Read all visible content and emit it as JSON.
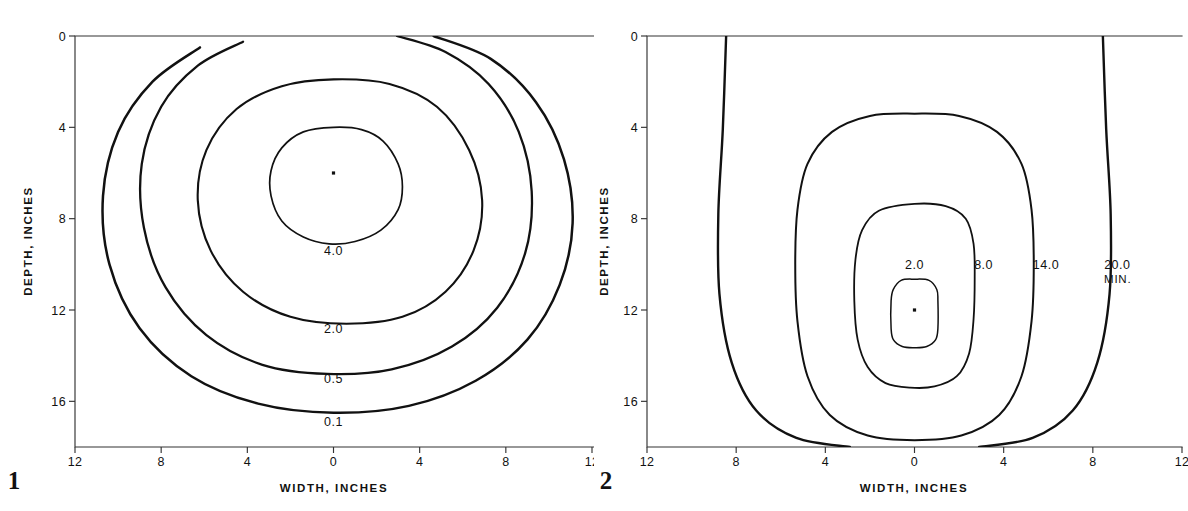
{
  "figure": {
    "kind": "contour-plot-pair",
    "background_color": "#ffffff",
    "line_color": "#111111",
    "axis_color": "#333333"
  },
  "panels": [
    {
      "number": "1",
      "xlabel": "WIDTH, INCHES",
      "ylabel": "DEPTH, INCHES",
      "x_ticks": [
        "12",
        "8",
        "4",
        "0",
        "4",
        "8",
        "12"
      ],
      "y_ticks": [
        "0",
        "4",
        "8",
        "12",
        "16"
      ],
      "unit_suffix": "",
      "contour_labels": [
        "4.0",
        "2.0",
        "0.5",
        "0.1"
      ],
      "center_marker": true
    },
    {
      "number": "2",
      "xlabel": "WIDTH,  INCHES",
      "ylabel": "DEPTH, INCHES",
      "x_ticks": [
        "12",
        "8",
        "4",
        "0",
        "4",
        "8",
        "12"
      ],
      "y_ticks": [
        "0",
        "4",
        "8",
        "12",
        "16"
      ],
      "unit_suffix": "MIN.",
      "contour_labels": [
        "2.0",
        "8.0",
        "14.0",
        "20.0"
      ],
      "center_marker": true
    }
  ],
  "chart_data": [
    {
      "type": "contour",
      "panel": "1",
      "title": "",
      "xlabel": "WIDTH, INCHES",
      "ylabel": "DEPTH, INCHES",
      "xlim": [
        -12,
        12
      ],
      "ylim": [
        0,
        18
      ],
      "y_inverted": true,
      "grid": false,
      "legend": "none",
      "x_ticks": [
        -12,
        -8,
        -4,
        0,
        4,
        8,
        12
      ],
      "x_tick_labels": [
        "12",
        "8",
        "4",
        "0",
        "4",
        "8",
        "12"
      ],
      "y_ticks": [
        0,
        4,
        8,
        12,
        16
      ],
      "y_tick_labels": [
        "0",
        "4",
        "8",
        "12",
        "16"
      ],
      "center_point": [
        0,
        6
      ],
      "levels": [
        {
          "label": "4.0",
          "label_position": [
            0,
            9.6
          ],
          "stroke_width": 1.7,
          "closed": true,
          "outline": [
            [
              0.0,
              4.0
            ],
            [
              1.3,
              4.1
            ],
            [
              2.3,
              4.6
            ],
            [
              3.0,
              5.6
            ],
            [
              3.2,
              6.6
            ],
            [
              3.0,
              7.6
            ],
            [
              2.2,
              8.5
            ],
            [
              1.0,
              9.0
            ],
            [
              -0.2,
              9.1
            ],
            [
              -1.4,
              8.8
            ],
            [
              -2.4,
              8.1
            ],
            [
              -2.9,
              7.0
            ],
            [
              -2.9,
              5.9
            ],
            [
              -2.4,
              4.9
            ],
            [
              -1.4,
              4.2
            ]
          ]
        },
        {
          "label": "2.0",
          "label_position": [
            0,
            13.0
          ],
          "stroke_width": 2.1,
          "closed": true,
          "outline": [
            [
              0.0,
              1.9
            ],
            [
              2.6,
              2.1
            ],
            [
              4.8,
              3.1
            ],
            [
              6.3,
              5.0
            ],
            [
              6.9,
              7.2
            ],
            [
              6.5,
              9.4
            ],
            [
              5.2,
              11.2
            ],
            [
              3.2,
              12.3
            ],
            [
              0.6,
              12.6
            ],
            [
              -2.0,
              12.3
            ],
            [
              -4.2,
              11.2
            ],
            [
              -5.7,
              9.4
            ],
            [
              -6.3,
              7.2
            ],
            [
              -5.9,
              5.0
            ],
            [
              -4.5,
              3.2
            ],
            [
              -2.4,
              2.2
            ]
          ]
        },
        {
          "label": "0.5",
          "label_position": [
            0,
            15.2
          ],
          "stroke_width": 2.3,
          "closed": false,
          "outline": [
            [
              2.95,
              0.0
            ],
            [
              5.2,
              0.7
            ],
            [
              7.2,
              2.1
            ],
            [
              8.6,
              4.2
            ],
            [
              9.2,
              6.8
            ],
            [
              8.9,
              9.5
            ],
            [
              7.6,
              11.9
            ],
            [
              5.5,
              13.6
            ],
            [
              2.7,
              14.6
            ],
            [
              -0.3,
              14.8
            ],
            [
              -3.3,
              14.4
            ],
            [
              -5.9,
              13.1
            ],
            [
              -7.8,
              11.0
            ],
            [
              -8.8,
              8.4
            ],
            [
              -8.9,
              5.6
            ],
            [
              -8.0,
              3.1
            ],
            [
              -6.3,
              1.3
            ],
            [
              -4.2,
              0.25
            ]
          ]
        },
        {
          "label": "0.1",
          "label_position": [
            0,
            17.1
          ],
          "stroke_width": 2.5,
          "closed": false,
          "outline": [
            [
              4.65,
              0.0
            ],
            [
              7.3,
              1.0
            ],
            [
              9.4,
              2.9
            ],
            [
              10.7,
              5.4
            ],
            [
              11.1,
              8.2
            ],
            [
              10.5,
              10.9
            ],
            [
              9.0,
              13.3
            ],
            [
              6.6,
              15.1
            ],
            [
              3.5,
              16.2
            ],
            [
              0.0,
              16.5
            ],
            [
              -3.5,
              16.1
            ],
            [
              -6.6,
              14.9
            ],
            [
              -9.0,
              12.8
            ],
            [
              -10.4,
              10.0
            ],
            [
              -10.7,
              7.0
            ],
            [
              -10.0,
              4.2
            ],
            [
              -8.4,
              2.0
            ],
            [
              -6.2,
              0.5
            ]
          ]
        }
      ]
    },
    {
      "type": "contour",
      "panel": "2",
      "title": "",
      "xlabel": "WIDTH,  INCHES",
      "ylabel": "DEPTH, INCHES",
      "xlim": [
        -12,
        12
      ],
      "ylim": [
        0,
        18
      ],
      "y_inverted": true,
      "grid": false,
      "legend": "none",
      "unit_suffix": "MIN.",
      "x_ticks": [
        -12,
        -8,
        -4,
        0,
        4,
        8,
        12
      ],
      "x_tick_labels": [
        "12",
        "8",
        "4",
        "0",
        "4",
        "8",
        "12"
      ],
      "y_ticks": [
        0,
        4,
        8,
        12,
        16
      ],
      "y_tick_labels": [
        "0",
        "4",
        "8",
        "12",
        "16"
      ],
      "center_point": [
        0,
        12
      ],
      "levels": [
        {
          "label": "2.0",
          "label_position": [
            0,
            10.2
          ],
          "stroke_width": 1.5,
          "closed": true,
          "outline": [
            [
              0.0,
              10.65
            ],
            [
              0.65,
              10.7
            ],
            [
              1.0,
              11.1
            ],
            [
              1.05,
              11.6
            ],
            [
              1.05,
              12.8
            ],
            [
              0.95,
              13.3
            ],
            [
              0.55,
              13.6
            ],
            [
              0.0,
              13.65
            ],
            [
              -0.55,
              13.6
            ],
            [
              -0.95,
              13.3
            ],
            [
              -1.05,
              12.8
            ],
            [
              -1.05,
              11.6
            ],
            [
              -0.95,
              11.1
            ],
            [
              -0.6,
              10.7
            ]
          ]
        },
        {
          "label": "8.0",
          "label_position": [
            3.1,
            10.2
          ],
          "stroke_width": 1.8,
          "closed": true,
          "outline": [
            [
              0.0,
              7.35
            ],
            [
              1.4,
              7.45
            ],
            [
              2.3,
              8.0
            ],
            [
              2.65,
              9.1
            ],
            [
              2.7,
              10.6
            ],
            [
              2.65,
              12.4
            ],
            [
              2.45,
              13.9
            ],
            [
              1.9,
              14.9
            ],
            [
              0.9,
              15.35
            ],
            [
              -0.2,
              15.4
            ],
            [
              -1.3,
              15.2
            ],
            [
              -2.1,
              14.5
            ],
            [
              -2.55,
              13.3
            ],
            [
              -2.7,
              11.6
            ],
            [
              -2.65,
              9.8
            ],
            [
              -2.35,
              8.5
            ],
            [
              -1.6,
              7.65
            ]
          ]
        },
        {
          "label": "14.0",
          "label_position": [
            5.9,
            10.2
          ],
          "stroke_width": 2.0,
          "closed": true,
          "outline": [
            [
              0.0,
              3.4
            ],
            [
              2.0,
              3.5
            ],
            [
              3.7,
              4.2
            ],
            [
              4.8,
              5.6
            ],
            [
              5.25,
              7.6
            ],
            [
              5.35,
              10.0
            ],
            [
              5.25,
              12.5
            ],
            [
              4.8,
              14.9
            ],
            [
              3.8,
              16.6
            ],
            [
              2.1,
              17.5
            ],
            [
              0.0,
              17.7
            ],
            [
              -2.1,
              17.5
            ],
            [
              -3.8,
              16.6
            ],
            [
              -4.8,
              14.9
            ],
            [
              -5.25,
              12.5
            ],
            [
              -5.35,
              10.0
            ],
            [
              -5.25,
              7.6
            ],
            [
              -4.8,
              5.6
            ],
            [
              -3.7,
              4.2
            ],
            [
              -2.0,
              3.5
            ]
          ]
        },
        {
          "label": "20.0",
          "label_position": [
            9.1,
            10.2
          ],
          "stroke_width": 2.4,
          "closed": false,
          "outline": [
            [
              2.9,
              18.0
            ],
            [
              5.3,
              17.6
            ],
            [
              7.1,
              16.4
            ],
            [
              8.2,
              14.3
            ],
            [
              8.75,
              11.3
            ],
            [
              8.8,
              7.8
            ],
            [
              8.6,
              4.1
            ],
            [
              8.45,
              0.0
            ]
          ],
          "outline_mirror": [
            [
              -2.9,
              18.0
            ],
            [
              -5.3,
              17.6
            ],
            [
              -7.1,
              16.4
            ],
            [
              -8.2,
              14.3
            ],
            [
              -8.75,
              11.3
            ],
            [
              -8.8,
              7.8
            ],
            [
              -8.6,
              4.1
            ],
            [
              -8.45,
              0.0
            ]
          ]
        }
      ]
    }
  ]
}
